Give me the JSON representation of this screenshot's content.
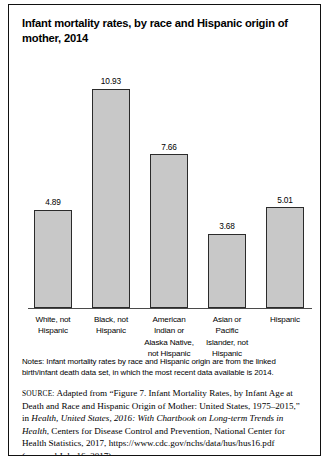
{
  "figure": {
    "title": "Infant mortality rates, by race and Hispanic origin of mother, 2014",
    "notes": "Notes: Infant mortality rates by race and Hispanic origin are from the linked birth/infant death data set, in which the most recent data available is 2014.",
    "source": {
      "label": "SOURCE:",
      "part1": " Adapted from “Figure 7. Infant Mortality Rates, by Infant Age at Death and Race and Hispanic Origin of Mother: United States, 1975–2015,” in ",
      "italic1": "Health, United States, 2016: With Chartbook on Long-term Trends in Health",
      "part2": ", Centers for Disease Control and Prevention, National Center for Health Statistics, 2017, https://www.cdc.gov/nchs/data/hus/hus16.pdf (accessed July 16, 2017)"
    }
  },
  "chart_data": {
    "type": "bar",
    "title": "Infant mortality rates, by race and Hispanic origin of mother, 2014",
    "xlabel": "",
    "ylabel": "",
    "ylim": [
      0,
      12.5
    ],
    "grid": false,
    "legend": null,
    "categories": [
      "White, not Hispanic",
      "Black, not Hispanic",
      "American Indian or Alaska Native, not Hispanic",
      "Asian or Pacific Islander, not Hispanic",
      "Hispanic"
    ],
    "category_lines": [
      [
        "White, not",
        "Hispanic"
      ],
      [
        "Black, not",
        "Hispanic"
      ],
      [
        "American",
        "Indian or",
        "Alaska Native,",
        "not Hispanic"
      ],
      [
        "Asian or",
        "Pacific",
        "Islander, not",
        "Hispanic"
      ],
      [
        "Hispanic"
      ]
    ],
    "values": [
      4.89,
      10.93,
      7.66,
      3.68,
      5.01
    ],
    "value_labels": [
      "4.89",
      "10.93",
      "7.66",
      "3.68",
      "5.01"
    ],
    "colors": {
      "bar_fill": "#c8c8c8",
      "bar_stroke": "#2b2b2b",
      "axis": "#4a4a4a",
      "text": "#000000",
      "border": "#111111"
    }
  }
}
